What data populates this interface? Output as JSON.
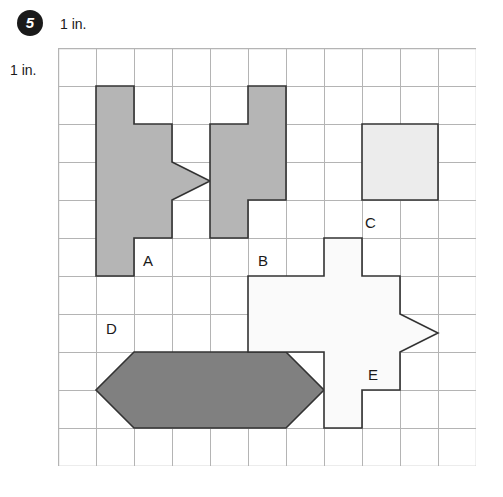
{
  "problem": {
    "number": "5"
  },
  "units": {
    "top_label": "1 in.",
    "left_label": "1 in."
  },
  "grid": {
    "columns": 11,
    "rows": 11,
    "cell_size_px": 38,
    "line_color": "#b4b4b4",
    "background_color": "#ffffff"
  },
  "colors": {
    "fill_medium_gray": "#b5b5b5",
    "fill_light_gray": "#ececec",
    "fill_dark_gray": "#808080",
    "fill_white": "#fafafa",
    "outline": "#333333",
    "text": "#1a1a1a",
    "badge_background": "#1a1a1a",
    "badge_text": "#ffffff"
  },
  "shapes": [
    {
      "id": "shape-a",
      "label": "A",
      "fill": "#b5b5b5",
      "stroke": "#333333",
      "description": "arrow with rectangular tail",
      "label_pos": {
        "x": 85,
        "y": 204
      },
      "points": "38,38 76,38 76,76 114,76 114,114 152,133 114,152 114,190 76,190 76,228 38,228"
    },
    {
      "id": "shape-b",
      "label": "B",
      "fill": "#b5b5b5",
      "stroke": "#333333",
      "description": "z-shaped zigzag of six squares",
      "label_pos": {
        "x": 200,
        "y": 204
      },
      "points": "190,38 228,38 228,152 190,152 190,190 152,190 152,76 190,76"
    },
    {
      "id": "shape-c",
      "label": "C",
      "fill": "#ececec",
      "stroke": "#333333",
      "description": "two by two square",
      "label_pos": {
        "x": 307,
        "y": 166
      },
      "points": "304,76 380,76 380,152 304,152"
    },
    {
      "id": "shape-d",
      "label": "D",
      "fill": "#808080",
      "stroke": "#333333",
      "description": "elongated hexagon",
      "label_pos": {
        "x": 48,
        "y": 272
      },
      "points": "76,304 228,304 266,342 228,380 76,380 38,342"
    },
    {
      "id": "shape-e",
      "label": "E",
      "fill": "#fafafa",
      "stroke": "#333333",
      "description": "cross with arrow point",
      "label_pos": {
        "x": 310,
        "y": 318
      },
      "points": "266,190 304,190 304,228 342,228 342,266 380,285 342,304 342,342 304,342 304,380 266,380 266,304 190,304 190,228 266,228"
    }
  ]
}
